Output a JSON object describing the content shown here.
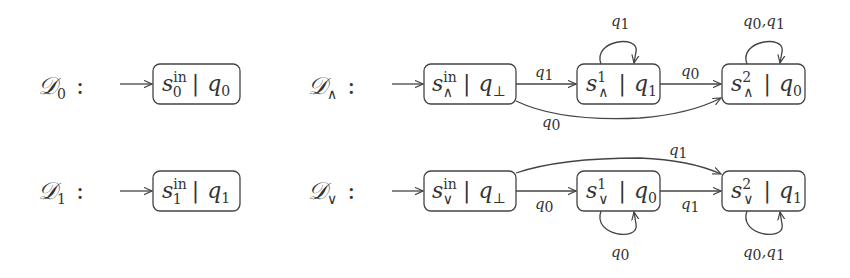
{
  "automata": [
    {
      "id": "D0",
      "name": "𝒟",
      "name_sub": "0",
      "colon": ":",
      "states": [
        {
          "id": "s0_in",
          "base": "s",
          "sup": "in",
          "sub": "0",
          "sep": "|",
          "q": "q",
          "q_sub": "0",
          "initial": true
        }
      ],
      "transitions": []
    },
    {
      "id": "D1",
      "name": "𝒟",
      "name_sub": "1",
      "colon": ":",
      "states": [
        {
          "id": "s1_in",
          "base": "s",
          "sup": "in",
          "sub": "1",
          "sep": "|",
          "q": "q",
          "q_sub": "1",
          "initial": true
        }
      ],
      "transitions": []
    },
    {
      "id": "D_and",
      "name": "𝒟",
      "name_sub": "∧",
      "colon": ":",
      "states": [
        {
          "id": "s_and_in",
          "base": "s",
          "sup": "in",
          "sub": "∧",
          "sep": "|",
          "q": "q",
          "q_sub": "⊥",
          "initial": true
        },
        {
          "id": "s_and_1",
          "base": "s",
          "sup": "1",
          "sub": "∧",
          "sep": "|",
          "q": "q",
          "q_sub": "1"
        },
        {
          "id": "s_and_2",
          "base": "s",
          "sup": "2",
          "sub": "∧",
          "sep": "|",
          "q": "q",
          "q_sub": "0"
        }
      ],
      "transitions": [
        {
          "from": "s_and_in",
          "to": "s_and_1",
          "label": "q",
          "label_sub": "1"
        },
        {
          "from": "s_and_in",
          "to": "s_and_2",
          "label": "q",
          "label_sub": "0"
        },
        {
          "from": "s_and_1",
          "to": "s_and_1",
          "label": "q",
          "label_sub": "1"
        },
        {
          "from": "s_and_1",
          "to": "s_and_2",
          "label": "q",
          "label_sub": "0"
        },
        {
          "from": "s_and_2",
          "to": "s_and_2",
          "label": "q0,q1",
          "label_parts": [
            "q",
            "0",
            ",q",
            "1"
          ]
        }
      ]
    },
    {
      "id": "D_or",
      "name": "𝒟",
      "name_sub": "∨",
      "colon": ":",
      "states": [
        {
          "id": "s_or_in",
          "base": "s",
          "sup": "in",
          "sub": "∨",
          "sep": "|",
          "q": "q",
          "q_sub": "⊥",
          "initial": true
        },
        {
          "id": "s_or_1",
          "base": "s",
          "sup": "1",
          "sub": "∨",
          "sep": "|",
          "q": "q",
          "q_sub": "0"
        },
        {
          "id": "s_or_2",
          "base": "s",
          "sup": "2",
          "sub": "∨",
          "sep": "|",
          "q": "q",
          "q_sub": "1"
        }
      ],
      "transitions": [
        {
          "from": "s_or_in",
          "to": "s_or_1",
          "label": "q",
          "label_sub": "0"
        },
        {
          "from": "s_or_in",
          "to": "s_or_2",
          "label": "q",
          "label_sub": "1"
        },
        {
          "from": "s_or_1",
          "to": "s_or_1",
          "label": "q",
          "label_sub": "0"
        },
        {
          "from": "s_or_1",
          "to": "s_or_2",
          "label": "q",
          "label_sub": "1"
        },
        {
          "from": "s_or_2",
          "to": "s_or_2",
          "label": "q0,q1",
          "label_parts": [
            "q",
            "0",
            ",q",
            "1"
          ]
        }
      ]
    }
  ]
}
